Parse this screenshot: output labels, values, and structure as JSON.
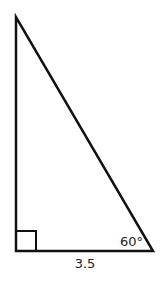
{
  "diagram": {
    "type": "right-triangle",
    "colors": {
      "stroke": "#111111",
      "text": "#222222",
      "background": "#ffffff"
    },
    "vertices": {
      "top": [
        16,
        17
      ],
      "bottom_left": [
        16,
        251
      ],
      "bottom_right": [
        153,
        251
      ]
    },
    "right_angle_marker": {
      "x": 16,
      "y": 231,
      "size": 20
    },
    "labels": {
      "base": "3.5",
      "angle": "60°"
    }
  }
}
